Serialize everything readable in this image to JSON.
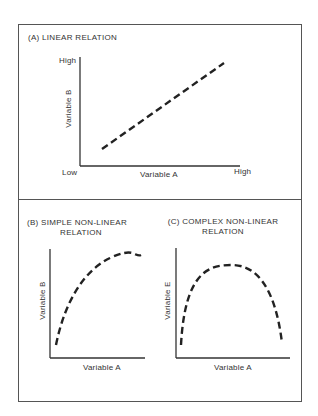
{
  "figure": {
    "panels": [
      {
        "id": "A",
        "title": "(A) LINEAR RELATION",
        "x_label": "Variable A",
        "y_label": "Variable B",
        "x_low": "Low",
        "x_high": "High",
        "y_high": "High",
        "curve": "linear increasing (dashed)"
      },
      {
        "id": "B",
        "title_line1": "(B) SIMPLE NON-LINEAR",
        "title_line2": "RELATION",
        "x_label": "Variable A",
        "y_label": "Variable B",
        "curve": "concave increasing (dashed)"
      },
      {
        "id": "C",
        "title_line1": "(C) COMPLEX NON-LINEAR",
        "title_line2": "RELATION",
        "x_label": "Variable A",
        "y_label": "Variable E",
        "curve": "inverted U (dashed)"
      }
    ]
  }
}
